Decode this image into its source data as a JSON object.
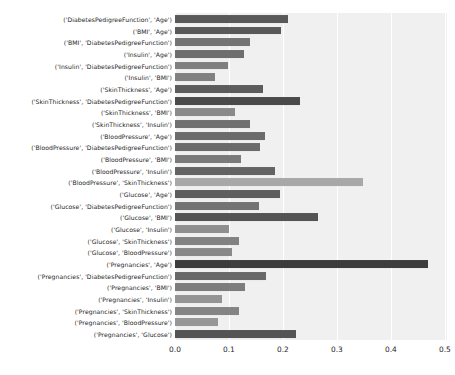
{
  "chart_data": {
    "type": "bar",
    "orientation": "horizontal",
    "title": "",
    "xlabel": "",
    "ylabel": "",
    "xlim": [
      0.0,
      0.504
    ],
    "ylim_categories_top_to_bottom": true,
    "grid": true,
    "grid_axis": "x",
    "legend": "none",
    "xticks": [
      "0.0",
      "0.1",
      "0.2",
      "0.3",
      "0.4",
      "0.5"
    ],
    "xtick_values": [
      0.0,
      0.1,
      0.2,
      0.3,
      0.4,
      0.5
    ],
    "background_color": "#f0f0f0",
    "figure_color": "#ffffff",
    "gridline_color": "#ffffff",
    "categories": [
      "('DiabetesPedigreeFunction', 'Age')",
      "('BMI', 'Age')",
      "('BMI', 'DiabetesPedigreeFunction')",
      "('Insulin', 'Age')",
      "('Insulin', 'DiabetesPedigreeFunction')",
      "('Insulin', 'BMI')",
      "('SkinThickness', 'Age')",
      "('SkinThickness', 'DiabetesPedigreeFunction')",
      "('SkinThickness', 'BMI')",
      "('SkinThickness', 'Insulin')",
      "('BloodPressure', 'Age')",
      "('BloodPressure', 'DiabetesPedigreeFunction')",
      "('BloodPressure', 'BMI')",
      "('BloodPressure', 'Insulin')",
      "('BloodPressure', 'SkinThickness')",
      "('Glucose', 'Age')",
      "('Glucose', 'DiabetesPedigreeFunction')",
      "('Glucose', 'BMI')",
      "('Glucose', 'Insulin')",
      "('Glucose', 'SkinThickness')",
      "('Glucose', 'BloodPressure')",
      "('Pregnancies', 'Age')",
      "('Pregnancies', 'DiabetesPedigreeFunction')",
      "('Pregnancies', 'BMI')",
      "('Pregnancies', 'Insulin')",
      "('Pregnancies', 'SkinThickness')",
      "('Pregnancies', 'BloodPressure')",
      "('Pregnancies', 'Glucose')"
    ],
    "values": [
      0.209,
      0.196,
      0.139,
      0.127,
      0.099,
      0.074,
      0.163,
      0.231,
      0.112,
      0.139,
      0.167,
      0.157,
      0.122,
      0.185,
      0.349,
      0.194,
      0.155,
      0.265,
      0.1,
      0.119,
      0.105,
      0.468,
      0.168,
      0.129,
      0.087,
      0.118,
      0.079,
      0.224
    ],
    "bar_colors": [
      "#595959",
      "#595959",
      "#737373",
      "#6e6e6e",
      "#808080",
      "#808080",
      "#5c5c5c",
      "#4a4a4a",
      "#8a8a8a",
      "#707070",
      "#6b6b6b",
      "#6b6b6b",
      "#7a7a7a",
      "#636363",
      "#a8a8a8",
      "#5e5e5e",
      "#737373",
      "#545454",
      "#8f8f8f",
      "#828282",
      "#898989",
      "#3d3d3d",
      "#686868",
      "#7c7c7c",
      "#949494",
      "#848484",
      "#969696",
      "#545454"
    ]
  }
}
